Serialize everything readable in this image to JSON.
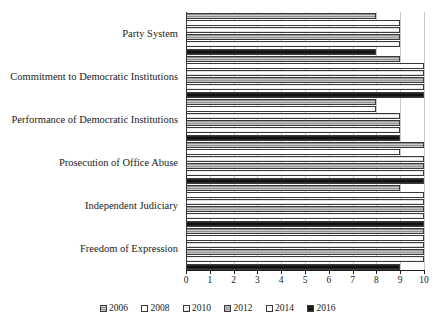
{
  "chart_data": {
    "type": "bar",
    "orientation": "horizontal",
    "title": "",
    "subtitle": "",
    "xlabel": "",
    "ylabel": "",
    "xlim": [
      0,
      10
    ],
    "xticks": [
      0,
      1,
      2,
      3,
      4,
      5,
      6,
      7,
      8,
      9,
      10
    ],
    "xtick_labels": [
      "0",
      "1",
      "2",
      "3",
      "4",
      "5",
      "6",
      "7",
      "8",
      "9",
      "10"
    ],
    "grid": true,
    "grid_axis": "x",
    "legend_position": "bottom",
    "categories": [
      "Party System",
      "Commitment to Democratic Institutions",
      "Performance of Democratic Institutions",
      "Prosecution of Office Abuse",
      "Independent Judiciary",
      "Freedom of Expression"
    ],
    "series": [
      {
        "name": "2006",
        "color": "#8e8e8e",
        "pattern": "horizontal-hatch-grey",
        "values": [
          8,
          9,
          8,
          10,
          9,
          10
        ]
      },
      {
        "name": "2008",
        "color": "#ffffff",
        "pattern": "solid-white",
        "values": [
          9,
          10,
          8,
          9,
          10,
          10
        ]
      },
      {
        "name": "2010",
        "color": "#fdfdfd",
        "pattern": "light-hatch-white",
        "values": [
          9,
          10,
          9,
          10,
          10,
          10
        ]
      },
      {
        "name": "2012",
        "color": "#9a9a9a",
        "pattern": "horizontal-hatch-grey",
        "values": [
          9,
          10,
          9,
          10,
          10,
          10
        ]
      },
      {
        "name": "2014",
        "color": "#ffffff",
        "pattern": "light-hatch-white",
        "values": [
          9,
          10,
          9,
          10,
          10,
          10
        ]
      },
      {
        "name": "2016",
        "color": "#111111",
        "pattern": "solid-black",
        "values": [
          8,
          10,
          9,
          10,
          10,
          9
        ]
      }
    ]
  },
  "legend": {
    "items": [
      {
        "label": "2006"
      },
      {
        "label": "2008"
      },
      {
        "label": "2010"
      },
      {
        "label": "2012"
      },
      {
        "label": "2014"
      },
      {
        "label": "2016"
      }
    ]
  }
}
